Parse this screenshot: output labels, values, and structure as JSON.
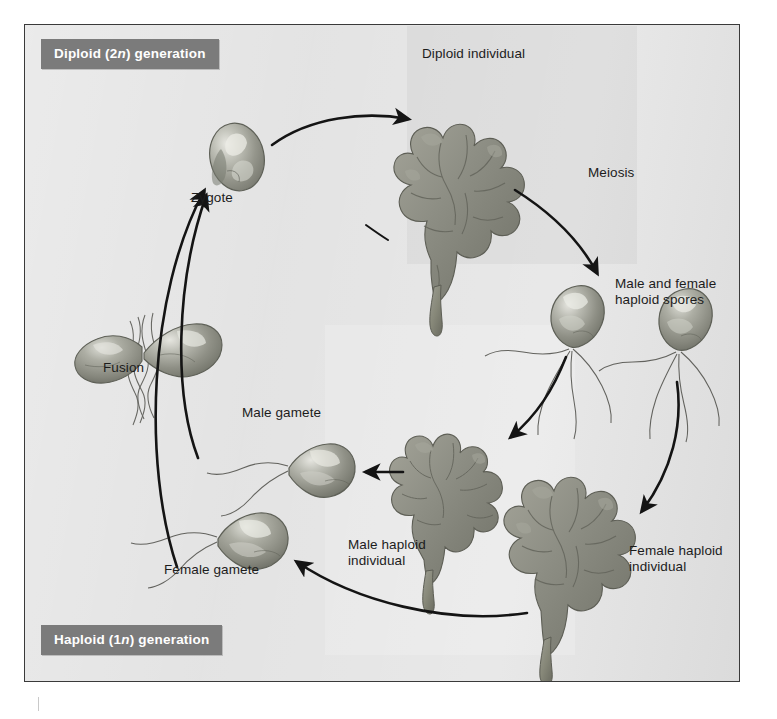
{
  "figure": {
    "background_color": "#e2e2e2",
    "banner_color": "#7b7b7b",
    "banner_text_color": "#ffffff",
    "organism_color": "#8e8f86",
    "arrow_color": "#141414"
  },
  "banners": {
    "diploid_prefix": "Diploid (2",
    "diploid_italic": "n",
    "diploid_suffix": ") generation",
    "haploid_prefix": "Haploid (1",
    "haploid_italic": "n",
    "haploid_suffix": ") generation"
  },
  "labels": {
    "diploid_individual": "Diploid individual",
    "zygote": "Zygote",
    "meiosis": "Meiosis",
    "haploid_spores": "Male and female\nhaploid spores",
    "fusion": "Fusion",
    "male_gamete": "Male gamete",
    "female_gamete": "Female gamete",
    "male_haploid_individual": "Male haploid\nindividual",
    "female_haploid_individual": "Female haploid\nindividual"
  },
  "diagram_data": {
    "type": "cycle-diagram",
    "cycle_direction": "clockwise",
    "generations": [
      {
        "name": "Diploid (2n) generation",
        "stages": [
          "Zygote",
          "Diploid individual"
        ]
      },
      {
        "name": "Haploid (1n) generation",
        "stages": [
          "Male and female haploid spores",
          "Male haploid individual",
          "Female haploid individual",
          "Male gamete",
          "Female gamete"
        ]
      }
    ],
    "processes": [
      "Meiosis",
      "Fusion"
    ],
    "transitions": [
      {
        "from": "Zygote",
        "to": "Diploid individual",
        "label": ""
      },
      {
        "from": "Diploid individual",
        "to": "Male and female haploid spores",
        "label": "Meiosis"
      },
      {
        "from": "Male and female haploid spores",
        "to": "Male haploid individual",
        "label": ""
      },
      {
        "from": "Male and female haploid spores",
        "to": "Female haploid individual",
        "label": ""
      },
      {
        "from": "Male haploid individual",
        "to": "Male gamete",
        "label": ""
      },
      {
        "from": "Female haploid individual",
        "to": "Female gamete",
        "label": ""
      },
      {
        "from": "Male gamete",
        "to": "Zygote",
        "label": "Fusion"
      },
      {
        "from": "Female gamete",
        "to": "Zygote",
        "label": "Fusion"
      }
    ],
    "organisms": [
      {
        "name": "Diploid individual",
        "form": "frilly-seaweed-thallus",
        "ploidy": "2n"
      },
      {
        "name": "Male haploid individual",
        "form": "frilly-seaweed-thallus",
        "ploidy": "1n"
      },
      {
        "name": "Female haploid individual",
        "form": "frilly-seaweed-thallus",
        "ploidy": "1n"
      },
      {
        "name": "Male and female haploid spores",
        "form": "flagellated-cell",
        "flagella": 4,
        "ploidy": "1n"
      },
      {
        "name": "Male gamete",
        "form": "flagellated-cell",
        "flagella": 2,
        "ploidy": "1n"
      },
      {
        "name": "Female gamete",
        "form": "flagellated-cell",
        "flagella": 2,
        "ploidy": "1n"
      },
      {
        "name": "Zygote",
        "form": "oval-cell",
        "flagella": 0,
        "ploidy": "2n"
      },
      {
        "name": "Fusion",
        "form": "two-fusing-gametes",
        "flagella": 4,
        "ploidy": "1n"
      }
    ]
  }
}
